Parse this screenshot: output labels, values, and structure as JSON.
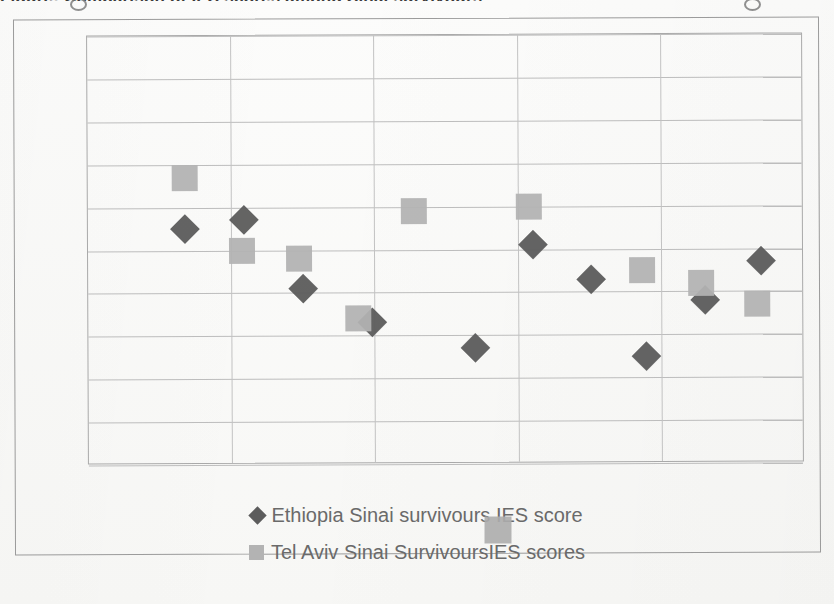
{
  "chart_data": {
    "type": "scatter",
    "title": "Figure: Comparison of IES scores among Sinai survivours",
    "xlabel": "",
    "ylabel": "",
    "ylim": [
      0,
      100
    ],
    "ytick_labels": [
      "100",
      "90",
      "80",
      "70",
      "60",
      "50",
      "40",
      "30",
      "20",
      "10",
      "0"
    ],
    "ytick_values": [
      100,
      90,
      80,
      70,
      60,
      50,
      40,
      30,
      20,
      10,
      0
    ],
    "grid": "horizontal-and-vertical",
    "xaxis_tick_labels_visible": false,
    "x_gridline_count": 4,
    "legend_position": "bottom",
    "colors": {
      "ethiopia_marker": "#5c5c5c",
      "telaviv_marker": "#b3b3b3",
      "gridline": "#bdbdbd",
      "axis_text": "#6a6a6a",
      "plot_border": "#a9a9a9"
    },
    "series": [
      {
        "name": "Ethiopia Sinai survivours  IES score",
        "marker": "diamond",
        "color": "#5c5c5c",
        "points": [
          {
            "x": 1.85,
            "y": 55
          },
          {
            "x": 2.68,
            "y": 57
          },
          {
            "x": 3.5,
            "y": 41
          },
          {
            "x": 4.47,
            "y": 33
          },
          {
            "x": 5.91,
            "y": 27
          },
          {
            "x": 6.72,
            "y": 51
          },
          {
            "x": 7.53,
            "y": 43
          },
          {
            "x": 8.29,
            "y": 25
          },
          {
            "x": 9.12,
            "y": 38
          },
          {
            "x": 9.9,
            "y": 47
          }
        ]
      },
      {
        "name": "Tel Aviv Sinai SurvivoursIES scores",
        "marker": "square",
        "color": "#b3b3b3",
        "points": [
          {
            "x": 1.85,
            "y": 67
          },
          {
            "x": 2.65,
            "y": 50
          },
          {
            "x": 3.44,
            "y": 48
          },
          {
            "x": 4.27,
            "y": 34
          },
          {
            "x": 5.06,
            "y": 59
          },
          {
            "x": 6.66,
            "y": 60
          },
          {
            "x": 8.24,
            "y": 45
          },
          {
            "x": 9.06,
            "y": 42
          },
          {
            "x": 9.84,
            "y": 37
          }
        ]
      }
    ],
    "legend": [
      {
        "label": "Ethiopia Sinai survivours  IES score",
        "marker": "diamond"
      },
      {
        "label": "Tel Aviv Sinai SurvivoursIES scores",
        "marker": "square"
      }
    ]
  }
}
